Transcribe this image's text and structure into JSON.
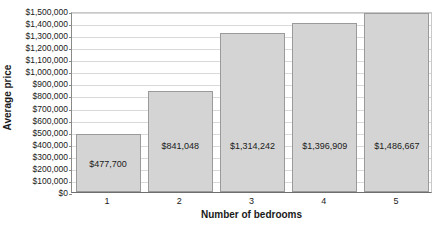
{
  "chart_data": {
    "type": "bar",
    "title": "",
    "xlabel": "Number of bedrooms",
    "ylabel": "Average price",
    "categories": [
      "1",
      "2",
      "3",
      "4",
      "5"
    ],
    "values": [
      477700,
      841048,
      1314242,
      1396909,
      1486667
    ],
    "data_labels": [
      "$477,700",
      "$841,048",
      "$1,314,242",
      "$1,396,909",
      "$1,486,667"
    ],
    "ylim": [
      0,
      1500000
    ],
    "ytick_step": 100000,
    "ytick_labels": [
      "$1,500,000",
      "$1,400,000",
      "$1,300,000",
      "$1,200,000",
      "$1,100,000",
      "$1,000,000",
      "$900,000",
      "$800,000",
      "$700,000",
      "$600,000",
      "$500,000",
      "$400,000",
      "$300,000",
      "$200,000",
      "$100,000",
      "$0"
    ],
    "grid": true,
    "legend": "none",
    "colors": {
      "bar_fill": "#d4d4d4",
      "bar_border": "#9a9a9a",
      "gridline": "#d9d9d9",
      "axis": "#6e6e6e",
      "background": "#ffffff",
      "text": "#1a1a1a"
    }
  }
}
